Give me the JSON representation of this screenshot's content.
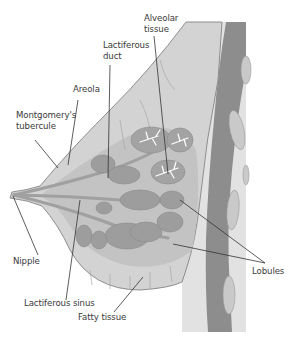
{
  "figure": {
    "type": "anatomical cross-section",
    "colors": {
      "background": "#ffffff",
      "tissue_light": "#d9d9d9",
      "tissue_mid": "#bdbdbd",
      "lobule": "#9c9c9c",
      "muscle": "#8a8a8a",
      "rib": "#b9b9b9",
      "leader_line": "#333333",
      "label_text": "#3a3a3a"
    }
  },
  "labels": {
    "alveolar_tissue": {
      "line1": "Alveolar",
      "line2": "tissue"
    },
    "lactiferous_duct": {
      "line1": "Lactiferous",
      "line2": "duct"
    },
    "areola": "Areola",
    "montgomery": {
      "line1": "Montgomery's",
      "line2": "tubercule"
    },
    "nipple": "Nipple",
    "lactiferous_sinus": "Lactiferous sinus",
    "fatty_tissue": "Fatty tissue",
    "lobules": "Lobules"
  }
}
